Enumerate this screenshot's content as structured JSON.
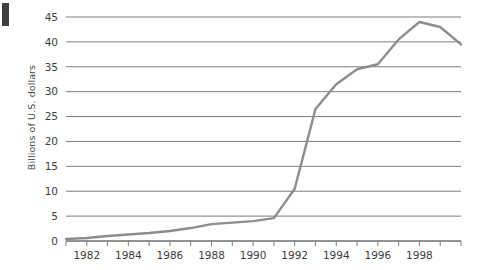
{
  "marks": {
    "corner_block": "#3f3f3f"
  },
  "colors": {
    "line": "#8d8d8d",
    "grid": "#6e6e6e",
    "axis": "#6e6e6e",
    "text": "#3d3d3d",
    "background": "#ffffff"
  },
  "chart_data": {
    "type": "line",
    "title": "",
    "xlabel": "",
    "ylabel": "Billions of U.S. dollars",
    "xlim": [
      1981,
      2000
    ],
    "ylim": [
      0,
      45
    ],
    "grid": true,
    "legend": "none",
    "ytick_labels": [
      "0",
      "5",
      "10",
      "15",
      "20",
      "25",
      "30",
      "35",
      "40",
      "45"
    ],
    "ytick_values": [
      0,
      5,
      10,
      15,
      20,
      25,
      30,
      35,
      40,
      45
    ],
    "xtick_labels": [
      "1982",
      "1984",
      "1986",
      "1988",
      "1990",
      "1992",
      "1994",
      "1996",
      "1998"
    ],
    "xtick_values": [
      1982,
      1984,
      1986,
      1988,
      1990,
      1992,
      1994,
      1996,
      1998
    ],
    "xtick_minor_values": [
      1981,
      1983,
      1985,
      1987,
      1989,
      1991,
      1993,
      1995,
      1997,
      1999,
      2000
    ],
    "x": [
      1981,
      1982,
      1983,
      1984,
      1985,
      1986,
      1987,
      1988,
      1989,
      1990,
      1991,
      1992,
      1993,
      1994,
      1995,
      1996,
      1997,
      1998,
      1999,
      2000
    ],
    "values": [
      0.4,
      0.6,
      1.0,
      1.3,
      1.6,
      2.0,
      2.6,
      3.4,
      3.7,
      4.0,
      4.6,
      10.5,
      26.5,
      31.5,
      34.5,
      35.5,
      40.5,
      44.0,
      43.0,
      39.5
    ],
    "series": [
      {
        "name": "value",
        "values": [
          0.4,
          0.6,
          1.0,
          1.3,
          1.6,
          2.0,
          2.6,
          3.4,
          3.7,
          4.0,
          4.6,
          10.5,
          26.5,
          31.5,
          34.5,
          35.5,
          40.5,
          44.0,
          43.0,
          39.5
        ]
      }
    ],
    "annotations": []
  }
}
